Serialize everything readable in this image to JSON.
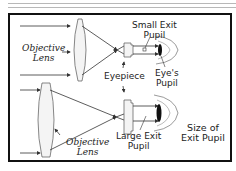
{
  "diagram": {
    "labels": {
      "objective_lens_top": [
        "Objective",
        "Lens"
      ],
      "objective_lens_bottom": [
        "Objective",
        "Lens"
      ],
      "small_exit_pupil": [
        "Small Exit",
        "Pupil"
      ],
      "eyepiece": "Eyepiece",
      "eyes_pupil": [
        "Eye's",
        "Pupil"
      ],
      "large_exit_pupil": [
        "Large Exit",
        "Pupil"
      ],
      "size_of_exit_pupil": [
        "Size of",
        "Exit Pupil"
      ]
    },
    "colors": {
      "frame": "#111111",
      "lines": "#333333",
      "lens_fill": "#f4f4f4"
    }
  }
}
